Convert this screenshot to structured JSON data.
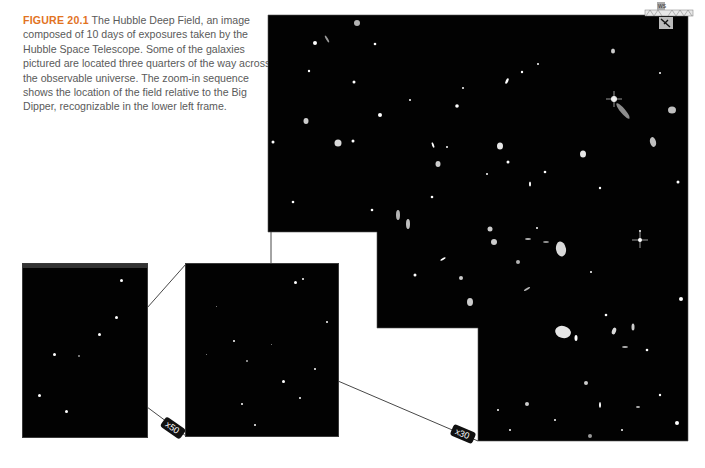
{
  "caption": {
    "figure_label": "FIGURE 20.1",
    "text": "The Hubble Deep Field, an image composed of 10 days of exposures taken by the Hubble Space Telescope. Some of the galaxies pictured are located three quarters of the way across the observable universe. The zoom-in sequence shows the location of the field relative to the Big Dipper, recognizable in the lower left frame."
  },
  "panels": [
    {
      "name": "big-dipper-frame",
      "description": "Big Dipper star field"
    },
    {
      "name": "zoom-frame",
      "description": "Intermediate zoom star field"
    },
    {
      "name": "hubble-deep-field",
      "description": "Hubble Deep Field galaxies"
    }
  ],
  "zoom_labels": {
    "first": "x50",
    "second": "x30"
  },
  "inset": {
    "label": "WS"
  },
  "colors": {
    "figure_label": "#e2731f",
    "caption_text": "#5a5a5a",
    "sky": "#020202"
  }
}
